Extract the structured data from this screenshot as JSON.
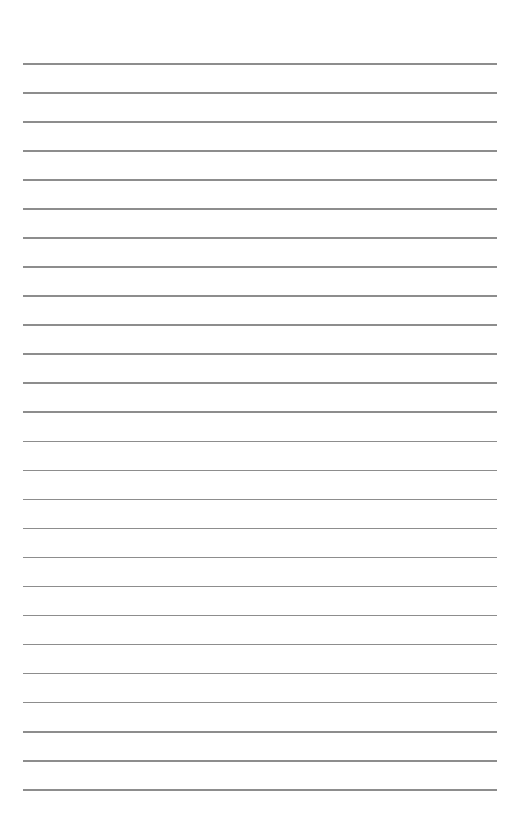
{
  "page": {
    "type": "lined-paper",
    "background_color": "#ffffff",
    "line_color": "#8d8d8d",
    "line_count": 26,
    "first_line_y": 63,
    "line_spacing": 29.04,
    "line_left_x": 23,
    "line_right_x": 497
  }
}
